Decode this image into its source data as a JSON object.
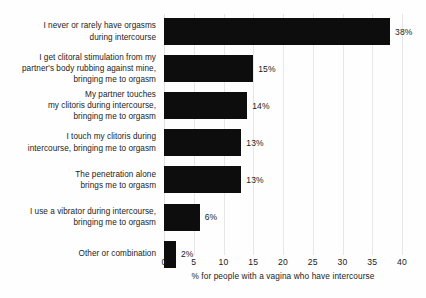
{
  "chart_data": {
    "type": "bar",
    "orientation": "horizontal",
    "title": "",
    "subtitle": "",
    "xlabel": "% for people with a vagina who have intercourse",
    "ylabel": "",
    "xlim": [
      0,
      40
    ],
    "xticks": [
      0,
      5,
      10,
      15,
      20,
      25,
      30,
      35,
      40
    ],
    "xtick_labels": [
      "0",
      "5",
      "10",
      "15",
      "20",
      "25",
      "30",
      "35",
      "40"
    ],
    "grid": "vertical",
    "legend": null,
    "bar_color": "#0d0d0d",
    "gridline_color": "#e6e6e6",
    "background_color": "#fefefe",
    "categories": [
      "I never or rarely have orgasms during intercourse",
      "I get clitoral stimulation from my partner's body rubbing against mine, bringing me to orgasm",
      "My partner touches my clitoris during intercourse, bringing me to orgasm",
      "I touch my clitoris during intercourse, bringing me to orgasm",
      "The penetration alone brings me to orgasm",
      "I use a vibrator during intercourse, bringing me to orgasm",
      "Other or combination"
    ],
    "values": [
      38,
      15,
      14,
      13,
      13,
      6,
      2
    ],
    "data_labels": [
      "38%",
      "15%",
      "14%",
      "13%",
      "13%",
      "6%",
      "2%"
    ],
    "bars": [
      {
        "label_lines": [
          "I never or rarely have orgasms",
          "during intercourse"
        ],
        "value": 38,
        "data_label": "38%"
      },
      {
        "label_lines": [
          "I get clitoral stimulation from my",
          "partner's body rubbing against mine,",
          "bringing me to orgasm"
        ],
        "value": 15,
        "data_label": "15%"
      },
      {
        "label_lines": [
          "My partner touches",
          "my clitoris during intercourse,",
          "bringing me to orgasm"
        ],
        "value": 14,
        "data_label": "14%"
      },
      {
        "label_lines": [
          "I touch my clitoris during",
          "intercourse, bringing me to orgasm"
        ],
        "value": 13,
        "data_label": "13%"
      },
      {
        "label_lines": [
          "The penetration alone",
          "brings me to orgasm"
        ],
        "value": 13,
        "data_label": "13%"
      },
      {
        "label_lines": [
          "I use a vibrator during intercourse,",
          "bringing me to orgasm"
        ],
        "value": 6,
        "data_label": "6%"
      },
      {
        "label_lines": [
          "Other or combination"
        ],
        "value": 2,
        "data_label": "2%"
      }
    ]
  }
}
